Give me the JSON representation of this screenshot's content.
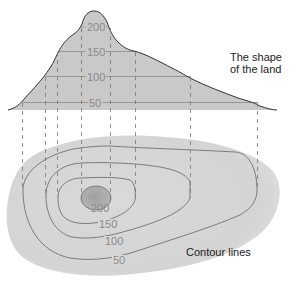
{
  "diagram": {
    "profile": {
      "caption_line1": "The shape",
      "caption_line2": "of the land",
      "levels": [
        {
          "value": "200",
          "label": "200"
        },
        {
          "value": "150",
          "label": "150"
        },
        {
          "value": "100",
          "label": "100"
        },
        {
          "value": "50",
          "label": "50"
        }
      ]
    },
    "map": {
      "caption": "Contour lines",
      "levels": [
        {
          "value": "200",
          "label": "200"
        },
        {
          "value": "150",
          "label": "150"
        },
        {
          "value": "100",
          "label": "100"
        },
        {
          "value": "50",
          "label": "50"
        }
      ]
    },
    "colors": {
      "land_fill": "#c9c9c9",
      "map_fill": "#d6d6d6",
      "peak_fill": "#a9a9a9",
      "line": "#555555",
      "dash": "#777777",
      "label": "#8a8a8a",
      "caption": "#222222"
    }
  }
}
